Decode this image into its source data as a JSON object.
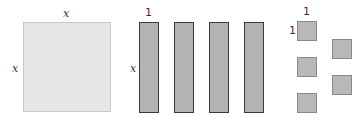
{
  "tiles": {
    "x_squared": {
      "top_label": "x",
      "side_label": "x",
      "count": 1
    },
    "x_strips": {
      "top_label": "1",
      "side_label": "x",
      "count": 4
    },
    "units": {
      "top_label": "1",
      "side_label": "1",
      "count": 5
    }
  },
  "colors": {
    "x_squared_fill": "#e6e6e6",
    "strip_fill": "#b3b3b3",
    "unit_fill": "#b8b8b8"
  }
}
